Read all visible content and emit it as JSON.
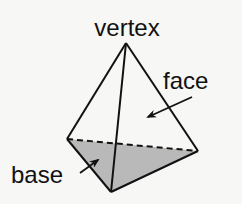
{
  "diagram": {
    "labels": {
      "vertex": "vertex",
      "face": "face",
      "base": "base"
    },
    "points": {
      "apex": [
        126,
        43
      ],
      "left": [
        67,
        139
      ],
      "right": [
        198,
        151
      ],
      "bottom": [
        111,
        192
      ]
    },
    "colors": {
      "stroke": "#111111",
      "base_fill": "#b9b9b9",
      "background": "#f7f7f5"
    }
  }
}
